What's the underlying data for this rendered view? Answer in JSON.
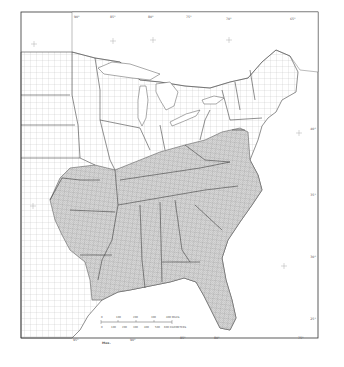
{
  "map": {
    "title": "",
    "region": "Eastern United States (county boundaries)",
    "shaded_region_description": "Southeastern states shaded (stippled)",
    "shaded_states": [
      "Texas (east)",
      "Oklahoma (east)",
      "Arkansas",
      "Louisiana",
      "Missouri (south)",
      "Mississippi",
      "Alabama",
      "Tennessee",
      "Kentucky",
      "Georgia",
      "Florida",
      "South Carolina",
      "North Carolina",
      "Virginia",
      "West Virginia",
      "Maryland",
      "Delaware",
      "New Jersey (south)"
    ],
    "colors": {
      "border": "#333333",
      "county_line": "#9a9a9a",
      "shaded_fill": "#cfcfcf",
      "water": "#ffffff",
      "background": "#ffffff"
    },
    "longitude_labels_top": [
      "90°",
      "85°",
      "80°",
      "75°",
      "70°",
      "65°"
    ],
    "longitude_labels_bottom": [
      "95°",
      "90°",
      "85°",
      "80°",
      "75°"
    ],
    "latitude_labels_right": [
      "40°",
      "35°",
      "30°",
      "25°"
    ],
    "country_label": "Mex.",
    "scale_bar": {
      "miles_ticks": [
        "0",
        "100",
        "200",
        "300",
        "400 MILES"
      ],
      "km_ticks": [
        "0",
        "100",
        "200",
        "300",
        "400",
        "500",
        "600 KILOMETERS"
      ]
    }
  }
}
